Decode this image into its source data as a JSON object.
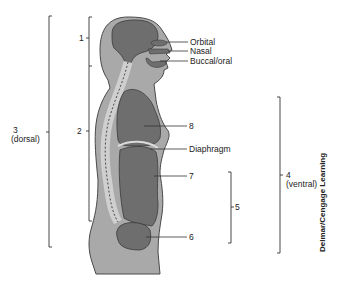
{
  "diagram": {
    "labels": {
      "orbital": "Orbital",
      "nasal": "Nasal",
      "buccal": "Buccal/oral",
      "l8": "8",
      "diaphragm": "Diaphragm",
      "l7": "7",
      "l6": "6",
      "l5": "5",
      "l1": "1",
      "l2": "2",
      "l3": "3",
      "dorsal": "(dorsal)",
      "l4": "4",
      "ventral": "(ventral)"
    },
    "credit": "Delmar/Cengage Learning",
    "colors": {
      "body": "#a9a9a9",
      "body_outline": "#4a4a4a",
      "cavity": "#6e6e6e",
      "spine": "#cfcfcf",
      "line": "#333333"
    }
  }
}
